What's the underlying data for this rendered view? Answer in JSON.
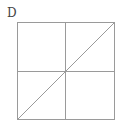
{
  "figure": {
    "label": "D",
    "line_color": "#9a9a9a",
    "square": {
      "x": 17,
      "y": 22,
      "size": 97
    },
    "elements": [
      "outer-square",
      "vertical-midline",
      "horizontal-midline",
      "diagonal-bottom-left-to-top-right"
    ]
  }
}
